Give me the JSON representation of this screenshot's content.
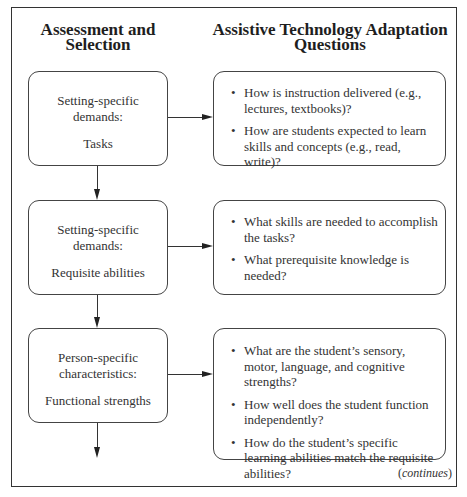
{
  "headers": {
    "left": [
      "Assessment and",
      "Selection"
    ],
    "right": [
      "Assistive Technology Adaptation",
      "Questions"
    ]
  },
  "rows": [
    {
      "category": [
        "Setting-specific",
        "demands:"
      ],
      "item": "Tasks",
      "questions": [
        "How is instruction delivered (e.g., lectures, textbooks)?",
        "How are students expected to learn skills and concepts (e.g., read, write)?"
      ]
    },
    {
      "category": [
        "Setting-specific",
        "demands:"
      ],
      "item": "Requisite abilities",
      "questions": [
        "What skills are needed to accomplish the tasks?",
        "What prerequisite knowledge is needed?"
      ]
    },
    {
      "category": [
        "Person-specific",
        "characteristics:"
      ],
      "item": "Functional strengths",
      "questions": [
        "What are the student’s sensory, motor, language, and cognitive strengths?",
        "How well does the student function independently?",
        "How do the student’s specific learning abilities match the requisite abilities?"
      ]
    }
  ],
  "footer": {
    "open": "(",
    "text": "continues",
    "close": ")"
  }
}
